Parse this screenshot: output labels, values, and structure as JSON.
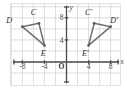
{
  "figure": {
    "width": 127,
    "height": 89,
    "background_color": "#ffffff",
    "grid_color": "#cfcfcf",
    "axis_color": "#4a4a4a",
    "shape_stroke_color": "#6e6e6e"
  },
  "chart_data": {
    "type": "scatter",
    "title": "",
    "xlabel": "x",
    "ylabel": "y",
    "xlim": [
      -10,
      10
    ],
    "ylim": [
      -3,
      11
    ],
    "grid": true,
    "legend": "none",
    "origin_label": "O",
    "x_ticks": [
      -8,
      -4,
      4,
      8
    ],
    "x_tick_labels": [
      "-8",
      "-4",
      "4",
      "8"
    ],
    "y_ticks": [
      4,
      8
    ],
    "y_tick_labels": [
      "4",
      "8"
    ],
    "grid_step": 2,
    "series": [
      {
        "name": "Triangle CDE",
        "closed": true,
        "points": [
          {
            "label": "C",
            "x": -5,
            "y": 7,
            "label_dx": -1.0,
            "label_dy": 1.9
          },
          {
            "label": "D",
            "x": -8,
            "y": 6.4,
            "label_dx": -2.4,
            "label_dy": 1.0
          },
          {
            "label": "E",
            "x": -4,
            "y": 3,
            "label_dx": -0.2,
            "label_dy": -1.6
          }
        ]
      },
      {
        "name": "Triangle C'D'E'",
        "closed": true,
        "points": [
          {
            "label": "C'",
            "x": 5,
            "y": 7,
            "label_dx": -1.0,
            "label_dy": 1.9
          },
          {
            "label": "D'",
            "x": 8,
            "y": 6.4,
            "label_dx": 0.6,
            "label_dy": 1.0
          },
          {
            "label": "E'",
            "x": 4,
            "y": 3,
            "label_dx": -0.6,
            "label_dy": -1.6
          }
        ]
      }
    ]
  },
  "axis_labels": {
    "x_axis_name": "x",
    "y_axis_name": "y"
  }
}
